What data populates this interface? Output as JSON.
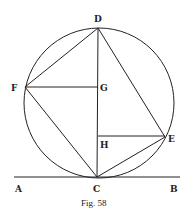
{
  "figure": {
    "caption": "Fig. 58",
    "stroke_color": "#222222",
    "background": "#ffffff"
  },
  "circle": {
    "cx": 99,
    "cy": 103,
    "r": 75
  },
  "points": {
    "A": {
      "label": "A",
      "x": 14,
      "y": 177
    },
    "B": {
      "label": "B",
      "x": 180,
      "y": 177
    },
    "C": {
      "label": "C",
      "x": 97,
      "y": 177
    },
    "D": {
      "label": "D",
      "x": 98,
      "y": 28
    },
    "E": {
      "label": "E",
      "x": 165,
      "y": 137
    },
    "F": {
      "label": "F",
      "x": 25,
      "y": 87
    },
    "G": {
      "label": "G",
      "x": 98,
      "y": 87
    },
    "H": {
      "label": "H",
      "x": 98,
      "y": 136
    }
  },
  "segments": [
    "AB",
    "DC",
    "DF",
    "FC",
    "DE",
    "EC",
    "FG",
    "HE"
  ]
}
